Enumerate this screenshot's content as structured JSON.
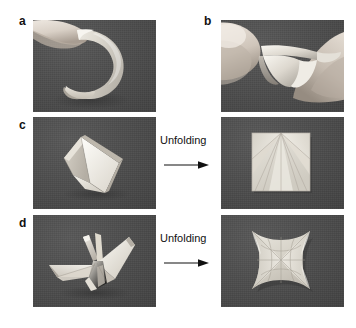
{
  "figure": {
    "type": "multi-panel-photo-figure",
    "background_color": "#ffffff",
    "photo_background_color": "#4d4d4d",
    "paper_color": "#dcdcd6",
    "text_color": "#111111",
    "panels": [
      {
        "id": "a",
        "label": "a",
        "caption_alt": "Hand holding a curled strip of paper forming a spiral",
        "x": 33,
        "y": 20,
        "width": 123,
        "height": 92
      },
      {
        "id": "b",
        "label": "b",
        "caption_alt": "Two hands bending a paper strip into a fold",
        "x": 221,
        "y": 20,
        "width": 123,
        "height": 92
      },
      {
        "id": "c",
        "label": "c",
        "caption_alt": "Folded paper module standing on dark background",
        "x": 33,
        "y": 117,
        "width": 123,
        "height": 92
      },
      {
        "id": "c2",
        "label": "",
        "caption_alt": "Unfolded square sheet with radial crease pattern",
        "x": 221,
        "y": 117,
        "width": 123,
        "height": 92
      },
      {
        "id": "d",
        "label": "d",
        "caption_alt": "Folded origami crane",
        "x": 33,
        "y": 215,
        "width": 123,
        "height": 92
      },
      {
        "id": "d2",
        "label": "",
        "caption_alt": "Unfolded square sheet with crane crease pattern and concave edges",
        "x": 221,
        "y": 215,
        "width": 123,
        "height": 92
      }
    ],
    "transitions": [
      {
        "id": "t-c",
        "label": "Unfolding",
        "x": 160,
        "y": 140,
        "arrow_x": 165,
        "arrow_y": 166,
        "arrow_length": 40
      },
      {
        "id": "t-d",
        "label": "Unfolding",
        "x": 160,
        "y": 238,
        "arrow_x": 165,
        "arrow_y": 264,
        "arrow_length": 40
      }
    ],
    "labels": {
      "a": "a",
      "b": "b",
      "c": "c",
      "d": "d"
    },
    "transition_text": "Unfolding"
  }
}
